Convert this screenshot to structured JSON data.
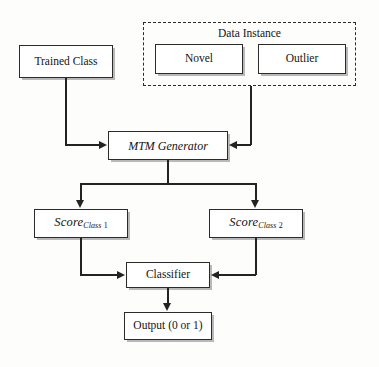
{
  "diagram": {
    "type": "flowchart",
    "nodes": {
      "trained_class": {
        "label": "Trained Class"
      },
      "data_instance_group": {
        "label": "Data Instance"
      },
      "novel": {
        "label": "Novel"
      },
      "outlier": {
        "label": "Outlier"
      },
      "mtm_generator": {
        "label": "MTM Generator"
      },
      "score_class_1": {
        "base": "Score",
        "subscript_italic": "Class",
        "subscript_number": "1"
      },
      "score_class_2": {
        "base": "Score",
        "subscript_italic": "Class",
        "subscript_number": "2"
      },
      "classifier": {
        "label": "Classifier"
      },
      "output": {
        "label": "Output (0 or 1)"
      }
    },
    "edges": [
      {
        "from": "trained_class",
        "to": "mtm_generator",
        "arrow": "right"
      },
      {
        "from": "data_instance_group",
        "to": "mtm_generator",
        "arrow": "left"
      },
      {
        "from": "mtm_generator",
        "to": "score_class_1",
        "arrow": "down"
      },
      {
        "from": "mtm_generator",
        "to": "score_class_2",
        "arrow": "down"
      },
      {
        "from": "score_class_1",
        "to": "classifier",
        "arrow": "right"
      },
      {
        "from": "score_class_2",
        "to": "classifier",
        "arrow": "left"
      },
      {
        "from": "classifier",
        "to": "output",
        "arrow": "down"
      }
    ],
    "colors": {
      "stroke": "#2b2b2b",
      "box_fill": "#ffffff",
      "shadow": "#b9b9b9",
      "background": "#fdfdfc",
      "text": "#141414"
    }
  }
}
